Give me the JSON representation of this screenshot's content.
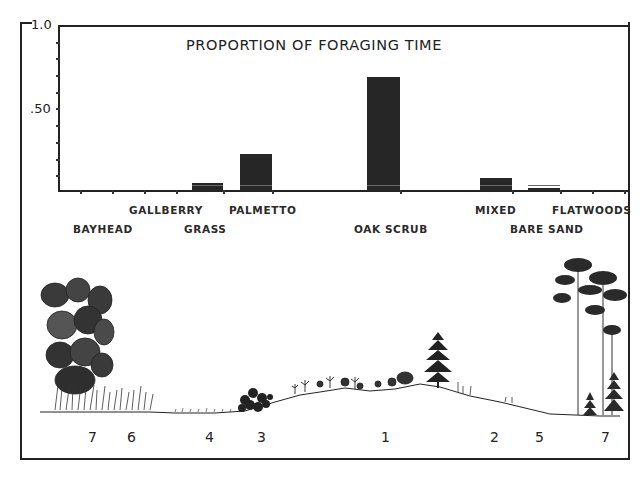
{
  "chart_data": {
    "type": "bar",
    "title": "PROPORTION OF FORAGING TIME",
    "xlabel": "",
    "ylabel": "",
    "ylim": [
      0,
      1.0
    ],
    "yticks": [
      "1.0",
      ".50"
    ],
    "grid": false,
    "legend": null,
    "categories": [
      "BAYHEAD",
      "GALLBERRY",
      "GRASS",
      "PALMETTO",
      "OAK SCRUB",
      "MIXED",
      "BARE SAND",
      "FLATWOODS"
    ],
    "values": [
      0,
      0,
      0.05,
      0.22,
      0.68,
      0.08,
      0.02,
      0
    ],
    "annotations": {
      "habitat_profile_zone_numbers": [
        "7",
        "6",
        "4",
        "3",
        "1",
        "2",
        "5",
        "7"
      ]
    }
  },
  "axis": {
    "y_top_label": "1.0",
    "y_mid_label": ".50"
  },
  "labels": {
    "bayhead": "BAYHEAD",
    "gallberry": "GALLBERRY",
    "grass": "GRASS",
    "palmetto": "PALMETTO",
    "oak_scrub": "OAK SCRUB",
    "mixed": "MIXED",
    "bare_sand": "BARE SAND",
    "flatwoods": "FLATWOODS"
  },
  "profile": {
    "zones": [
      "7",
      "6",
      "4",
      "3",
      "1",
      "2",
      "5",
      "7"
    ]
  },
  "colors": {
    "ink": "#222222",
    "bar": "#262626",
    "background": "#ffffff"
  }
}
